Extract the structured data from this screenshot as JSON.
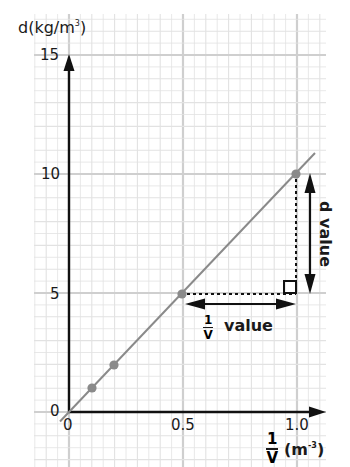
{
  "chart_data": {
    "type": "line",
    "title": "",
    "xlabel": "1/V (m^-3)",
    "ylabel": "d(kg/m^3)",
    "x": [
      0.1,
      0.2,
      0.5,
      1.0
    ],
    "values": [
      1,
      2,
      5,
      10
    ],
    "series": [
      {
        "name": "d vs 1/V",
        "x": [
          0.1,
          0.2,
          0.5,
          1.0
        ],
        "values": [
          1,
          2,
          5,
          10
        ],
        "line": "best-fit through origin"
      }
    ],
    "xlim": [
      0,
      1.1
    ],
    "ylim": [
      0,
      15
    ],
    "x_ticks": [
      "0",
      "0.5",
      "1.0"
    ],
    "y_ticks": [
      "0",
      "5",
      "10",
      "15"
    ],
    "grid": true,
    "annotations": [
      {
        "text": "d value",
        "type": "vertical double arrow",
        "from": [
          1.0,
          5
        ],
        "to": [
          1.0,
          10
        ]
      },
      {
        "text": "1/V value",
        "type": "horizontal double arrow",
        "from": [
          0.5,
          5
        ],
        "to": [
          1.0,
          5
        ]
      },
      {
        "type": "right-angle marker",
        "at": [
          1.0,
          5
        ]
      }
    ]
  },
  "axes": {
    "y_label_main": "d(kg/m",
    "y_label_sup": "3",
    "y_label_end": ")",
    "x_label_num": "1",
    "x_label_den": "V",
    "x_unit_main": "(m",
    "x_unit_sup": "-3",
    "x_unit_end": ")",
    "y_tick_0": "0",
    "y_tick_5": "5",
    "y_tick_10": "10",
    "y_tick_15": "15",
    "x_tick_0": "0",
    "x_tick_05": "0.5",
    "x_tick_10": "1.0"
  },
  "annotations": {
    "d_value": "d value",
    "inv_v_num": "1",
    "inv_v_den": "V",
    "inv_v_text": "value"
  },
  "colors": {
    "grid_minor": "#e2e2e2",
    "grid_major": "#cfcfcf",
    "axis": "#111111",
    "line": "#8a8a8a",
    "point": "#8a8a8a"
  }
}
